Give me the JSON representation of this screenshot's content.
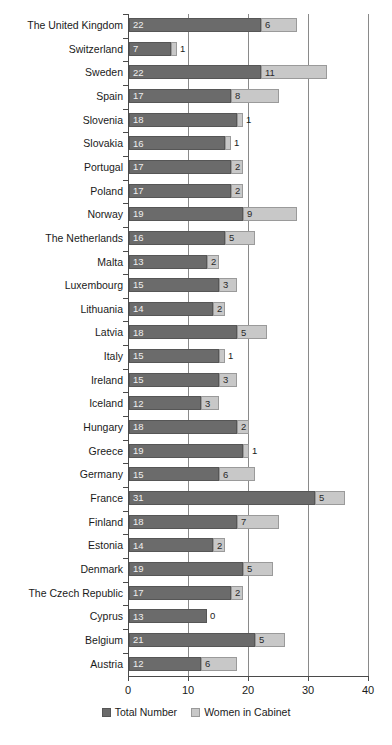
{
  "chart_data": {
    "type": "bar",
    "subtype": "horizontal-stacked",
    "title": "",
    "xlabel": "",
    "ylabel": "",
    "xlim": [
      0,
      40
    ],
    "xticks": [
      0,
      10,
      20,
      30,
      40
    ],
    "grid": "vertical",
    "legend_position": "bottom-center",
    "colors": {
      "total_number": "#6b6b6b",
      "women_in_cabinet": "#c8c8c8",
      "axis": "#4a4a4a",
      "gridline": "#8a8a8a",
      "background": "#ffffff"
    },
    "categories": [
      "The United Kingdom",
      "Switzerland",
      "Sweden",
      "Spain",
      "Slovenia",
      "Slovakia",
      "Portugal",
      "Poland",
      "Norway",
      "The Netherlands",
      "Malta",
      "Luxembourg",
      "Lithuania",
      "Latvia",
      "Italy",
      "Ireland",
      "Iceland",
      "Hungary",
      "Greece",
      "Germany",
      "France",
      "Finland",
      "Estonia",
      "Denmark",
      "The Czech Republic",
      "Cyprus",
      "Belgium",
      "Austria"
    ],
    "series": [
      {
        "name": "Total Number",
        "color": "#6b6b6b",
        "values": [
          22,
          7,
          22,
          17,
          18,
          16,
          17,
          17,
          19,
          16,
          13,
          15,
          14,
          18,
          15,
          15,
          12,
          18,
          19,
          15,
          31,
          18,
          14,
          19,
          17,
          13,
          21,
          12
        ]
      },
      {
        "name": "Women in Cabinet",
        "color": "#c8c8c8",
        "values": [
          6,
          1,
          11,
          8,
          1,
          1,
          2,
          2,
          9,
          5,
          2,
          3,
          2,
          5,
          1,
          3,
          3,
          2,
          1,
          6,
          5,
          7,
          2,
          5,
          2,
          0,
          5,
          6
        ]
      }
    ],
    "rows": [
      {
        "label": "The United Kingdom",
        "total": 22,
        "women": 6,
        "women_label_outside": false
      },
      {
        "label": "Switzerland",
        "total": 7,
        "women": 1,
        "women_label_outside": true
      },
      {
        "label": "Sweden",
        "total": 22,
        "women": 11,
        "women_label_outside": false
      },
      {
        "label": "Spain",
        "total": 17,
        "women": 8,
        "women_label_outside": false
      },
      {
        "label": "Slovenia",
        "total": 18,
        "women": 1,
        "women_label_outside": true
      },
      {
        "label": "Slovakia",
        "total": 16,
        "women": 1,
        "women_label_outside": true
      },
      {
        "label": "Portugal",
        "total": 17,
        "women": 2,
        "women_label_outside": false
      },
      {
        "label": "Poland",
        "total": 17,
        "women": 2,
        "women_label_outside": false
      },
      {
        "label": "Norway",
        "total": 19,
        "women": 9,
        "women_label_outside": false
      },
      {
        "label": "The Netherlands",
        "total": 16,
        "women": 5,
        "women_label_outside": false
      },
      {
        "label": "Malta",
        "total": 13,
        "women": 2,
        "women_label_outside": false
      },
      {
        "label": "Luxembourg",
        "total": 15,
        "women": 3,
        "women_label_outside": false
      },
      {
        "label": "Lithuania",
        "total": 14,
        "women": 2,
        "women_label_outside": false
      },
      {
        "label": "Latvia",
        "total": 18,
        "women": 5,
        "women_label_outside": false
      },
      {
        "label": "Italy",
        "total": 15,
        "women": 1,
        "women_label_outside": true
      },
      {
        "label": "Ireland",
        "total": 15,
        "women": 3,
        "women_label_outside": false
      },
      {
        "label": "Iceland",
        "total": 12,
        "women": 3,
        "women_label_outside": false
      },
      {
        "label": "Hungary",
        "total": 18,
        "women": 2,
        "women_label_outside": false
      },
      {
        "label": "Greece",
        "total": 19,
        "women": 1,
        "women_label_outside": true
      },
      {
        "label": "Germany",
        "total": 15,
        "women": 6,
        "women_label_outside": false
      },
      {
        "label": "France",
        "total": 31,
        "women": 5,
        "women_label_outside": false
      },
      {
        "label": "Finland",
        "total": 18,
        "women": 7,
        "women_label_outside": false
      },
      {
        "label": "Estonia",
        "total": 14,
        "women": 2,
        "women_label_outside": false
      },
      {
        "label": "Denmark",
        "total": 19,
        "women": 5,
        "women_label_outside": false
      },
      {
        "label": "The Czech Republic",
        "total": 17,
        "women": 2,
        "women_label_outside": false
      },
      {
        "label": "Cyprus",
        "total": 13,
        "women": 0,
        "women_label_outside": true
      },
      {
        "label": "Belgium",
        "total": 21,
        "women": 5,
        "women_label_outside": false
      },
      {
        "label": "Austria",
        "total": 12,
        "women": 6,
        "women_label_outside": false
      }
    ],
    "legend": [
      {
        "label": "Total Number",
        "key": "total",
        "color": "#6b6b6b"
      },
      {
        "label": "Women in Cabinet",
        "key": "women",
        "color": "#c8c8c8"
      }
    ]
  }
}
